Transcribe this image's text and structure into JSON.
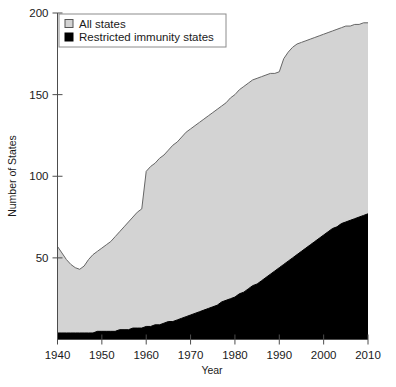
{
  "chart_data": {
    "type": "area",
    "title": "",
    "subtitle": "",
    "xlabel": "Year",
    "ylabel": "Number of States",
    "xlim": [
      1940,
      2010
    ],
    "ylim": [
      0,
      200
    ],
    "xticks": [
      1940,
      1950,
      1960,
      1970,
      1980,
      1990,
      2000,
      2010
    ],
    "yticks": [
      50,
      100,
      150,
      200
    ],
    "grid": false,
    "legend_position": "top-left",
    "stacked": false,
    "series": [
      {
        "name": "All states",
        "color": "#d3d3d3",
        "line_color": "#666666",
        "x": [
          1940,
          1941,
          1942,
          1943,
          1944,
          1945,
          1946,
          1947,
          1948,
          1949,
          1950,
          1951,
          1952,
          1953,
          1954,
          1955,
          1956,
          1957,
          1958,
          1959,
          1960,
          1961,
          1962,
          1963,
          1964,
          1965,
          1966,
          1967,
          1968,
          1969,
          1970,
          1971,
          1972,
          1973,
          1974,
          1975,
          1976,
          1977,
          1978,
          1979,
          1980,
          1981,
          1982,
          1983,
          1984,
          1985,
          1986,
          1987,
          1988,
          1989,
          1990,
          1991,
          1992,
          1993,
          1994,
          1995,
          1996,
          1997,
          1998,
          1999,
          2000,
          2001,
          2002,
          2003,
          2004,
          2005,
          2006,
          2007,
          2008,
          2009,
          2010
        ],
        "values": [
          57,
          53,
          49,
          46,
          44,
          43,
          45,
          49,
          52,
          54,
          56,
          58,
          60,
          63,
          66,
          69,
          72,
          75,
          78,
          80,
          103,
          106,
          108,
          111,
          113,
          116,
          119,
          121,
          124,
          127,
          129,
          131,
          133,
          135,
          137,
          139,
          141,
          143,
          145,
          148,
          150,
          153,
          155,
          157,
          159,
          160,
          161,
          162,
          163,
          163,
          164,
          172,
          176,
          179,
          181,
          182,
          183,
          184,
          185,
          186,
          187,
          188,
          189,
          190,
          191,
          192,
          192,
          193,
          193,
          194,
          194
        ]
      },
      {
        "name": "Restricted immunity states",
        "color": "#000000",
        "line_color": "#000000",
        "x": [
          1940,
          1941,
          1942,
          1943,
          1944,
          1945,
          1946,
          1947,
          1948,
          1949,
          1950,
          1951,
          1952,
          1953,
          1954,
          1955,
          1956,
          1957,
          1958,
          1959,
          1960,
          1961,
          1962,
          1963,
          1964,
          1965,
          1966,
          1967,
          1968,
          1969,
          1970,
          1971,
          1972,
          1973,
          1974,
          1975,
          1976,
          1977,
          1978,
          1979,
          1980,
          1981,
          1982,
          1983,
          1984,
          1985,
          1986,
          1987,
          1988,
          1989,
          1990,
          1991,
          1992,
          1993,
          1994,
          1995,
          1996,
          1997,
          1998,
          1999,
          2000,
          2001,
          2002,
          2003,
          2004,
          2005,
          2006,
          2007,
          2008,
          2009,
          2010
        ],
        "values": [
          4,
          4,
          4,
          4,
          4,
          4,
          4,
          4,
          4,
          5,
          5,
          5,
          5,
          5,
          6,
          6,
          6,
          7,
          7,
          7,
          8,
          8,
          9,
          9,
          10,
          11,
          11,
          12,
          13,
          14,
          15,
          16,
          17,
          18,
          19,
          20,
          21,
          23,
          24,
          25,
          26,
          28,
          29,
          31,
          33,
          34,
          36,
          38,
          40,
          42,
          44,
          46,
          48,
          50,
          52,
          54,
          56,
          58,
          60,
          62,
          64,
          66,
          68,
          69,
          71,
          72,
          73,
          74,
          75,
          76,
          77
        ]
      }
    ]
  },
  "legend": {
    "items": [
      {
        "label": "All states",
        "swatch": "#d3d3d3"
      },
      {
        "label": "Restricted immunity states",
        "swatch": "#000000"
      }
    ]
  },
  "axes": {
    "y_title": "Number of States",
    "x_title": "Year",
    "x_tick_labels": [
      "1940",
      "1950",
      "1960",
      "1970",
      "1980",
      "1990",
      "2000",
      "2010"
    ],
    "y_tick_labels": [
      "50",
      "100",
      "150",
      "200"
    ]
  },
  "colors": {
    "all_states_fill": "#d3d3d3",
    "restricted_fill": "#000000",
    "axis": "#4d4d4d",
    "text": "#1a1a1a",
    "background": "#ffffff"
  }
}
